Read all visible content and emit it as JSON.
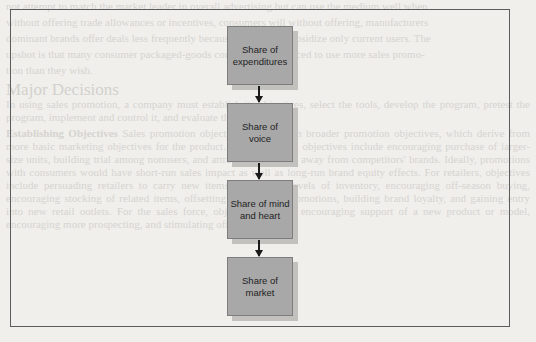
{
  "diagram": {
    "type": "flowchart",
    "direction": "top-to-bottom",
    "nodes": [
      {
        "id": "expenditures",
        "label": "Share of expenditures"
      },
      {
        "id": "voice",
        "label": "Share of voice"
      },
      {
        "id": "mind_heart",
        "label": "Share of mind and heart"
      },
      {
        "id": "market",
        "label": "Share of market"
      }
    ],
    "edges": [
      {
        "from": "expenditures",
        "to": "voice"
      },
      {
        "from": "voice",
        "to": "mind_heart"
      },
      {
        "from": "mind_heart",
        "to": "market"
      }
    ],
    "colors": {
      "box_fill": "#a8a8a8",
      "box_border": "#7d7d7d",
      "shadow": "#c2c1be",
      "arrow": "#1a1a1a",
      "frame": "#5c5c5c",
      "background": "#f0efec"
    }
  },
  "bleed_through": {
    "lines_top": [
      "not attempt to match the market leader in overall advertising but can use the medium well when",
      "without offering trade allowances or incentives, consumers will without offering, manufacturers",
      "dominant brands offer deals less frequently because most deals subsidize only current users. The",
      "upshot is that many consumer packaged-goods companies feel forced to use more sales promo-",
      "tion than they wish."
    ],
    "heading": "Major Decisions",
    "para1": "In using sales promotion, a company must establish its objectives, select the tools, develop the program, pretest the program, implement and control it, and evaluate the results.",
    "para2_lead": "Establishing Objectives",
    "para2": "Sales promotion objectives derive from broader promotion objectives, which derive from more basic marketing objectives for the product. For consumers, objectives include encouraging purchase of larger-size units, building trial among nonusers, and attracting switchers away from competitors' brands. Ideally, promotions with consumers would have short-run sales impact as well as long-run brand equity effects. For retailers, objectives include persuading retailers to carry new items and higher levels of inventory, encouraging off-season buying, encouraging stocking of related items, offsetting competitive promotions, building brand loyalty, and gaining entry into new retail outlets. For the sales force, objectives include encouraging support of a new product or model, encouraging more prospecting, and stimulating off-season sales."
  }
}
